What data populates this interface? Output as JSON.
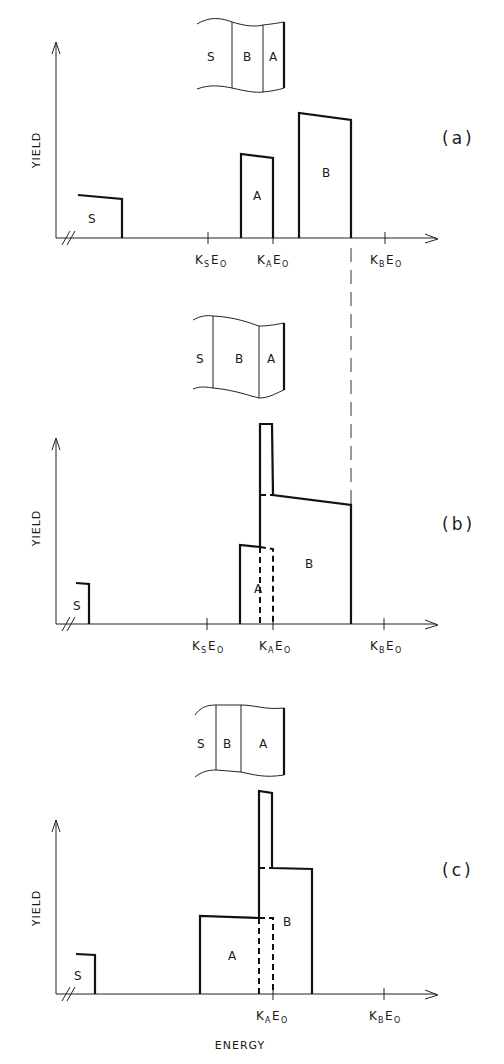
{
  "figure": {
    "x_axis_label": "ENERGY",
    "y_axis_label": "YIELD",
    "panels": [
      {
        "id": "a",
        "label": "(a)",
        "sample_layers": [
          "S",
          "B",
          "A"
        ],
        "peaks": [
          "S",
          "A",
          "B"
        ],
        "ticks": [
          {
            "k": "K",
            "sub": "S",
            "e": "E",
            "esub": "O"
          },
          {
            "k": "K",
            "sub": "A",
            "e": "E",
            "esub": "O"
          },
          {
            "k": "K",
            "sub": "B",
            "e": "E",
            "esub": "O"
          }
        ]
      },
      {
        "id": "b",
        "label": "(b)",
        "sample_layers": [
          "S",
          "B",
          "A"
        ],
        "peaks": [
          "S",
          "A",
          "B"
        ],
        "ticks": [
          {
            "k": "K",
            "sub": "S",
            "e": "E",
            "esub": "O"
          },
          {
            "k": "K",
            "sub": "A",
            "e": "E",
            "esub": "O"
          },
          {
            "k": "K",
            "sub": "B",
            "e": "E",
            "esub": "O"
          }
        ]
      },
      {
        "id": "c",
        "label": "(c)",
        "sample_layers": [
          "S",
          "B",
          "A"
        ],
        "peaks": [
          "S",
          "A",
          "B"
        ],
        "ticks": [
          {
            "k": "K",
            "sub": "A",
            "e": "E",
            "esub": "O"
          },
          {
            "k": "K",
            "sub": "B",
            "e": "E",
            "esub": "O"
          }
        ]
      }
    ]
  }
}
